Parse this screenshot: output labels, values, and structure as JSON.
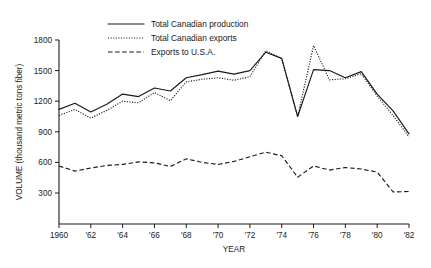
{
  "chart_data": {
    "type": "line",
    "title": "",
    "xlabel": "YEAR",
    "ylabel": "VOLUME (thousand metric tons fiber)",
    "xlim": [
      1960,
      1982
    ],
    "ylim": [
      0,
      1800
    ],
    "yticks": [
      300,
      600,
      900,
      1200,
      1500,
      1800
    ],
    "ytick_labels": [
      "300",
      "600",
      "900",
      "1200",
      "1500",
      "1800"
    ],
    "xticks": [
      1960,
      1962,
      1964,
      1966,
      1968,
      1970,
      1972,
      1974,
      1976,
      1978,
      1980,
      1982
    ],
    "xtick_labels": [
      "1960",
      "'62",
      "'64",
      "'66",
      "'68",
      "'70",
      "'72",
      "'74",
      "'76",
      "'78",
      "'80",
      "'82"
    ],
    "grid": false,
    "legend_position": "top-center",
    "x": [
      1960,
      1961,
      1962,
      1963,
      1964,
      1965,
      1966,
      1967,
      1968,
      1969,
      1970,
      1971,
      1972,
      1973,
      1974,
      1975,
      1976,
      1977,
      1978,
      1979,
      1980,
      1981,
      1982
    ],
    "series": [
      {
        "name": "Total Canadian production",
        "style": "solid",
        "values": [
          1120,
          1180,
          1095,
          1170,
          1270,
          1245,
          1330,
          1300,
          1430,
          1460,
          1495,
          1465,
          1500,
          1680,
          1620,
          1050,
          1510,
          1500,
          1430,
          1490,
          1270,
          1105,
          880
        ]
      },
      {
        "name": "Total Canadian exports",
        "style": "dotted",
        "values": [
          1060,
          1120,
          1035,
          1110,
          1200,
          1185,
          1285,
          1205,
          1390,
          1415,
          1430,
          1405,
          1440,
          1695,
          1615,
          1050,
          1745,
          1410,
          1420,
          1470,
          1250,
          1060,
          850
        ]
      },
      {
        "name": "Exports to U.S.A.",
        "style": "dashed",
        "values": [
          565,
          515,
          545,
          570,
          580,
          605,
          595,
          560,
          635,
          600,
          580,
          610,
          655,
          700,
          665,
          455,
          565,
          525,
          550,
          535,
          505,
          310,
          315
        ]
      }
    ]
  },
  "legend": {
    "items": [
      {
        "label": "Total Canadian production",
        "style": "solid"
      },
      {
        "label": "Total Canadian exports",
        "style": "dotted"
      },
      {
        "label": "Exports to U.S.A.",
        "style": "dashed"
      }
    ]
  },
  "colors": {
    "ink": "#1a1a1a",
    "background": "#ffffff"
  }
}
